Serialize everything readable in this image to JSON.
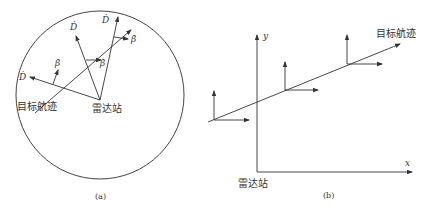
{
  "panel_a": {
    "caption": "(a)",
    "radar_label": "雷达站",
    "track_label": "目标航迹",
    "symbols": {
      "D_dot": "Ḋ",
      "beta_dot": "β̇"
    },
    "labels": [
      {
        "id": "d1",
        "text": "Ḋ"
      },
      {
        "id": "d2",
        "text": "Ḋ"
      },
      {
        "id": "d3",
        "text": "Ḋ"
      },
      {
        "id": "b1",
        "text": "β̇"
      },
      {
        "id": "b2",
        "text": "β̇"
      },
      {
        "id": "b3",
        "text": "β̇"
      }
    ]
  },
  "panel_b": {
    "caption": "(b)",
    "radar_label": "雷达站",
    "track_label": "目标航迹",
    "x_axis_label": "x",
    "y_axis_label": "y"
  }
}
